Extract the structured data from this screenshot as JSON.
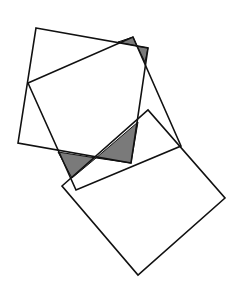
{
  "diagram": {
    "colors": {
      "stroke": "#111111",
      "shade": "#7a7a7a",
      "background": "#ffffff"
    },
    "shapes": [
      {
        "name": "square-upper",
        "points": "36,28 148,48 131,163 18,143"
      },
      {
        "name": "square-rotated",
        "points": "28,83 133,37 181,146 76,190"
      },
      {
        "name": "rectangle-lower",
        "points": "62,186 148,110 225,198 138,275"
      }
    ],
    "shaded_regions": [
      {
        "name": "shade-top-left",
        "points": "118,42 133,37 137,46"
      },
      {
        "name": "shade-top-right",
        "points": "137,46 148,48 145,62"
      },
      {
        "name": "shade-bottom-left",
        "points": "58,152 96,158 72,178"
      },
      {
        "name": "shade-bottom-right",
        "points": "96,158 138,122 131,163"
      }
    ]
  }
}
